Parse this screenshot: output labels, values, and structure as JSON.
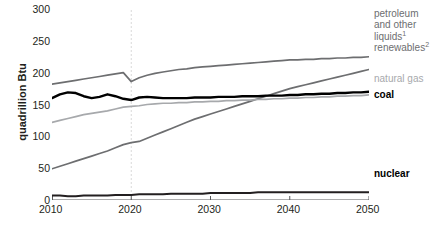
{
  "chart_data": {
    "type": "line",
    "title": "",
    "xlabel": "",
    "ylabel": "quadrillion Btu",
    "xlim": [
      2010,
      2050
    ],
    "ylim": [
      0,
      300
    ],
    "grid": false,
    "legend_position": "right",
    "xticks": [
      "2010",
      "2020",
      "2030",
      "2040",
      "2050"
    ],
    "yticks": [
      "0",
      "50",
      "100",
      "150",
      "200",
      "250",
      "300"
    ],
    "annotations": [
      {
        "name": "projection-divider",
        "x": 2020,
        "style": "dashed-vertical"
      }
    ],
    "x": [
      2010,
      2011,
      2012,
      2013,
      2014,
      2015,
      2016,
      2017,
      2018,
      2019,
      2020,
      2021,
      2022,
      2023,
      2024,
      2025,
      2026,
      2027,
      2028,
      2029,
      2030,
      2031,
      2032,
      2033,
      2034,
      2035,
      2036,
      2037,
      2038,
      2039,
      2040,
      2041,
      2042,
      2043,
      2044,
      2045,
      2046,
      2047,
      2048,
      2049,
      2050
    ],
    "series": [
      {
        "name": "petroleum and other liquids",
        "footnote": "1",
        "color": "#6d6e70",
        "width": 1.7,
        "values": [
          182,
          184,
          186,
          188,
          190,
          192,
          194,
          196,
          198,
          200,
          186,
          192,
          196,
          199,
          201,
          203,
          205,
          206,
          208,
          209,
          210,
          211,
          212,
          213,
          214,
          215,
          216,
          217,
          218,
          219,
          220,
          220,
          221,
          221,
          222,
          222,
          223,
          223,
          224,
          224,
          225
        ]
      },
      {
        "name": "renewables",
        "footnote": "2",
        "color": "#6d6e70",
        "width": 1.7,
        "values": [
          49,
          53,
          57,
          61,
          65,
          69,
          73,
          77,
          82,
          87,
          90,
          92,
          97,
          102,
          107,
          112,
          117,
          122,
          127,
          131,
          135,
          139,
          143,
          147,
          151,
          155,
          159,
          163,
          167,
          171,
          175,
          178,
          181,
          184,
          187,
          190,
          193,
          196,
          199,
          202,
          205
        ]
      },
      {
        "name": "natural gas",
        "footnote": "",
        "color": "#a7a9ac",
        "width": 1.7,
        "values": [
          122,
          125,
          128,
          131,
          134,
          136,
          138,
          140,
          143,
          146,
          147,
          148,
          150,
          151,
          152,
          152,
          153,
          153,
          154,
          154,
          155,
          155,
          156,
          156,
          157,
          157,
          158,
          158,
          159,
          159,
          160,
          160,
          161,
          161,
          162,
          162,
          163,
          163,
          164,
          164,
          165
        ]
      },
      {
        "name": "coal",
        "footnote": "",
        "color": "#000000",
        "width": 2.4,
        "values": [
          160,
          166,
          169,
          168,
          163,
          160,
          162,
          166,
          163,
          159,
          157,
          161,
          162,
          161,
          160,
          160,
          160,
          160,
          161,
          161,
          161,
          162,
          162,
          162,
          163,
          163,
          163,
          164,
          164,
          164,
          165,
          165,
          166,
          166,
          167,
          167,
          168,
          168,
          169,
          169,
          170
        ]
      },
      {
        "name": "nuclear",
        "footnote": "",
        "color": "#231f20",
        "width": 2.0,
        "values": [
          7,
          7,
          6,
          6,
          7,
          7,
          7,
          7,
          8,
          8,
          8,
          9,
          9,
          9,
          9,
          10,
          10,
          10,
          10,
          10,
          11,
          11,
          11,
          11,
          11,
          11,
          12,
          12,
          12,
          12,
          12,
          12,
          12,
          12,
          12,
          12,
          12,
          12,
          12,
          12,
          12
        ]
      }
    ]
  },
  "legend": {
    "entries": [
      {
        "label": "petroleum",
        "sup": "",
        "tone": "gray"
      },
      {
        "label": "and other",
        "sup": "",
        "tone": "gray"
      },
      {
        "label": "liquids",
        "sup": "1",
        "tone": "gray"
      },
      {
        "label": "renewables",
        "sup": "2",
        "tone": "gray"
      },
      {
        "label": "natural gas",
        "sup": "",
        "tone": "light"
      },
      {
        "label": "coal",
        "sup": "",
        "tone": "black"
      },
      {
        "label": "nuclear",
        "sup": "",
        "tone": "black"
      }
    ]
  },
  "axis": {
    "y_title": "quadrillion Btu"
  }
}
